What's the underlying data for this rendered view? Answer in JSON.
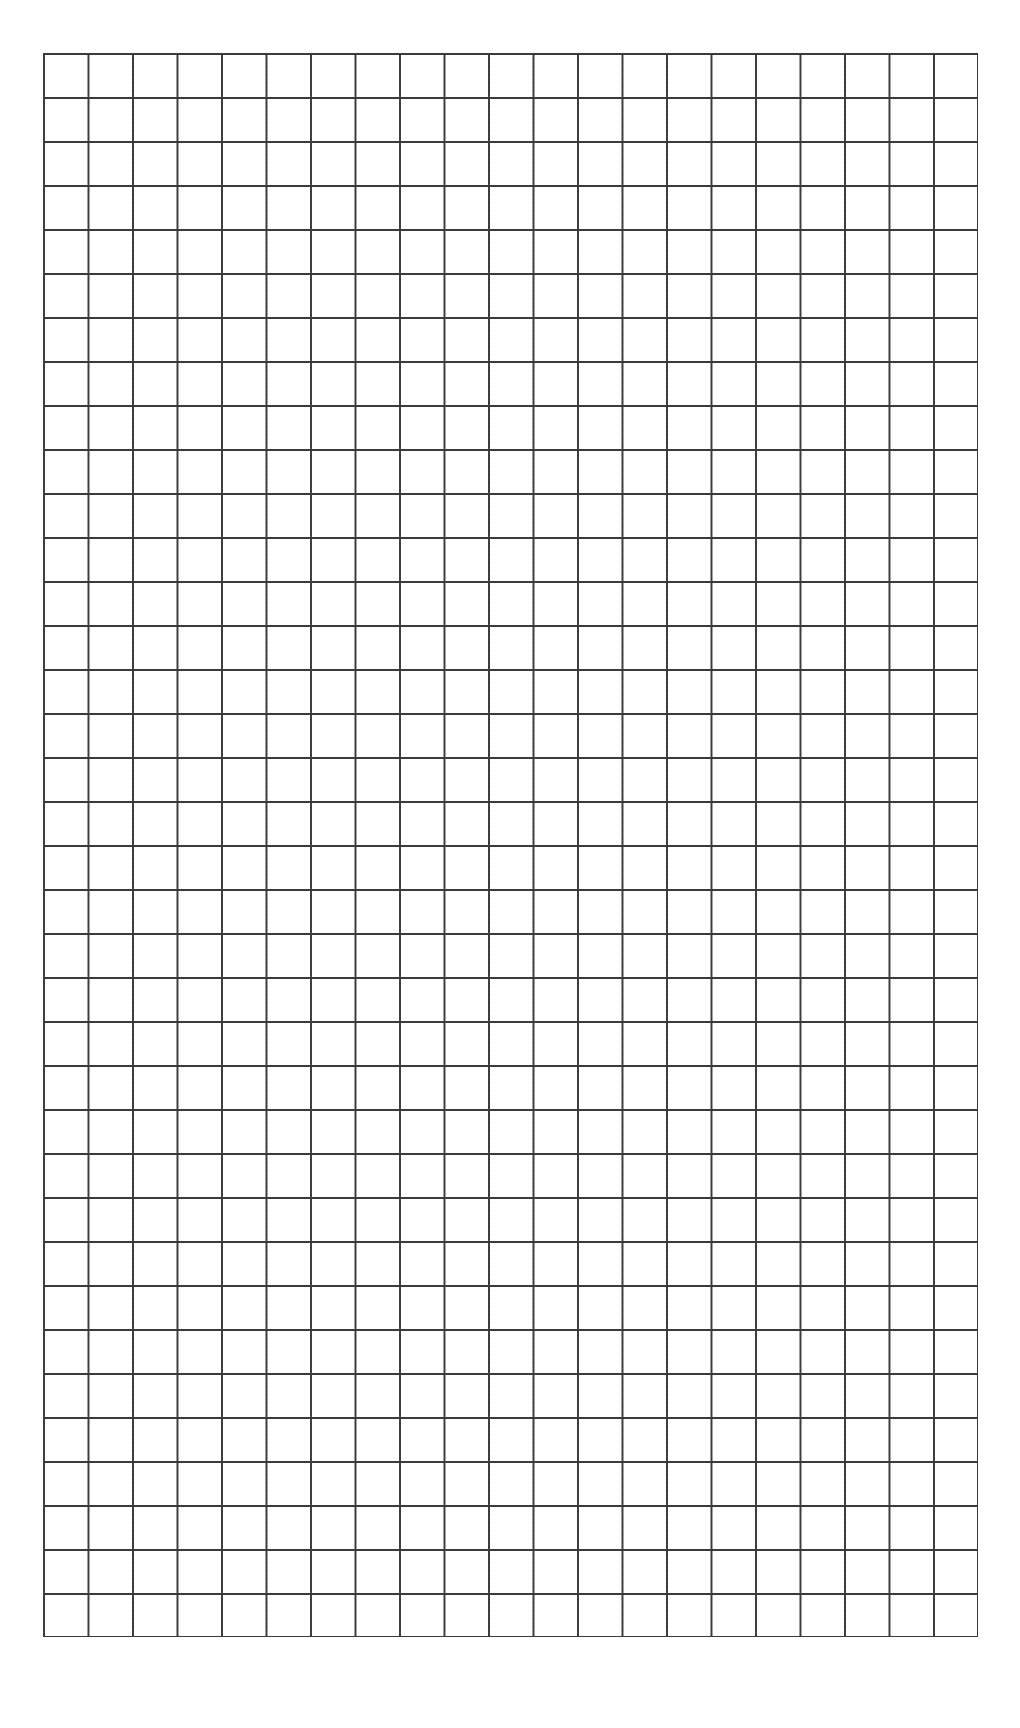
{
  "page": {
    "background_color": "#ffffff",
    "width": 1020,
    "height": 1728
  },
  "grid": {
    "title": "blank grid paper",
    "columns": 21,
    "rows": 36,
    "cell_width": 44.5,
    "cell_height": 44.0,
    "line_color": "#3a3a3a",
    "line_width": 1.8,
    "fill_color": "#ffffff",
    "left": 43,
    "top": 53,
    "width": 934,
    "height": 1584,
    "content_text": ""
  },
  "chart_data": {
    "type": "table",
    "title": "",
    "xlabel": "",
    "ylabel": "",
    "columns": 21,
    "rows": 36,
    "categories": [],
    "values": [],
    "grid": true,
    "legend": "none",
    "annotations": []
  }
}
